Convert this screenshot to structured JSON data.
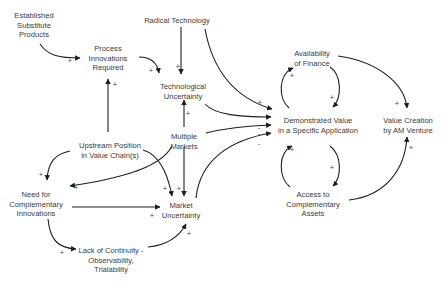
{
  "diagram": {
    "type": "causal-loop-diagram",
    "nodes": [
      {
        "id": "established_substitute",
        "lines": [
          "Established",
          "Substitute",
          "Products"
        ],
        "x": 34,
        "y": 11
      },
      {
        "id": "radical_technology",
        "lines": [
          "Radical Technology"
        ],
        "x": 177,
        "y": 16
      },
      {
        "id": "process_innovations",
        "lines": [
          "Process",
          "Innovations",
          "Required"
        ],
        "x": 108,
        "y": 44
      },
      {
        "id": "technological_uncertainty",
        "lines": [
          "Technological",
          "Uncertainty"
        ],
        "x": 183,
        "y": 82
      },
      {
        "id": "availability_finance",
        "lines": [
          "Availability",
          "of Finance"
        ],
        "x": 312,
        "y": 49
      },
      {
        "id": "upstream_position",
        "lines": [
          "Upstream Position",
          "in Value Chain(s)"
        ],
        "x": 110,
        "y": 141
      },
      {
        "id": "multiple_markets",
        "lines": [
          "Multiple",
          "Markets"
        ],
        "x": 184,
        "y": 132
      },
      {
        "id": "demonstrated_value",
        "lines": [
          "Demonstrated Value",
          "in a Specific Application"
        ],
        "x": 318,
        "y": 116
      },
      {
        "id": "value_creation",
        "lines": [
          "Value Creation",
          "by AM Venture"
        ],
        "x": 408,
        "y": 116
      },
      {
        "id": "need_complementary",
        "lines": [
          "Need for",
          "Complementary",
          "Innovations"
        ],
        "x": 36,
        "y": 190
      },
      {
        "id": "market_uncertainty",
        "lines": [
          "Market",
          "Uncertainty"
        ],
        "x": 181,
        "y": 201
      },
      {
        "id": "access_assets",
        "lines": [
          "Access to",
          "Complementary",
          "Assets"
        ],
        "x": 313,
        "y": 190
      },
      {
        "id": "lack_continuity",
        "lines": [
          "Lack of Continuity -",
          "Observability,",
          "Trialability"
        ],
        "x": 111,
        "y": 246
      }
    ],
    "edges": [
      {
        "from": "Established Substitute Products",
        "to": "Process Innovations Required",
        "polarity": "+"
      },
      {
        "from": "Upstream Position in Value Chain(s)",
        "to": "Process Innovations Required",
        "polarity": "+"
      },
      {
        "from": "Process Innovations Required",
        "to": "Technological Uncertainty",
        "polarity": "+"
      },
      {
        "from": "Radical Technology",
        "to": "Technological Uncertainty",
        "polarity": "+"
      },
      {
        "from": "Radical Technology",
        "to": "Demonstrated Value in a Specific Application",
        "polarity": "+"
      },
      {
        "from": "Technological Uncertainty",
        "to": "Demonstrated Value in a Specific Application",
        "polarity": "-"
      },
      {
        "from": "Multiple Markets",
        "to": "Demonstrated Value in a Specific Application",
        "polarity": "-"
      },
      {
        "from": "Market Uncertainty",
        "to": "Demonstrated Value in a Specific Application",
        "polarity": "-"
      },
      {
        "from": "Multiple Markets",
        "to": "Technological Uncertainty",
        "polarity": "+"
      },
      {
        "from": "Multiple Markets",
        "to": "Market Uncertainty",
        "polarity": "+"
      },
      {
        "from": "Multiple Markets",
        "to": "Need for Complementary Innovations",
        "polarity": "+"
      },
      {
        "from": "Upstream Position in Value Chain(s)",
        "to": "Need for Complementary Innovations",
        "polarity": "+"
      },
      {
        "from": "Upstream Position in Value Chain(s)",
        "to": "Market Uncertainty",
        "polarity": "+"
      },
      {
        "from": "Need for Complementary Innovations",
        "to": "Market Uncertainty",
        "polarity": "+"
      },
      {
        "from": "Need for Complementary Innovations",
        "to": "Lack of Continuity - Observability, Trialability",
        "polarity": "+"
      },
      {
        "from": "Lack of Continuity - Observability, Trialability",
        "to": "Market Uncertainty",
        "polarity": "+"
      },
      {
        "from": "Demonstrated Value in a Specific Application",
        "to": "Availability of Finance",
        "polarity": "+"
      },
      {
        "from": "Availability of Finance",
        "to": "Demonstrated Value in a Specific Application",
        "polarity": "+"
      },
      {
        "from": "Demonstrated Value in a Specific Application",
        "to": "Access to Complementary Assets",
        "polarity": "+"
      },
      {
        "from": "Access to Complementary Assets",
        "to": "Demonstrated Value in a Specific Application",
        "polarity": "+"
      },
      {
        "from": "Availability of Finance",
        "to": "Value Creation by AM Venture",
        "polarity": "+"
      },
      {
        "from": "Access to Complementary Assets",
        "to": "Value Creation by AM Venture",
        "polarity": "+"
      }
    ],
    "signs": [
      {
        "s": "+",
        "x": 70,
        "y": 61
      },
      {
        "s": "+",
        "x": 115,
        "y": 85
      },
      {
        "s": "+",
        "x": 151,
        "y": 71
      },
      {
        "s": "+",
        "x": 178,
        "y": 67
      },
      {
        "s": "+",
        "x": 188,
        "y": 114
      },
      {
        "s": "+",
        "x": 260,
        "y": 103
      },
      {
        "s": "-",
        "x": 259,
        "y": 128
      },
      {
        "s": "-",
        "x": 259,
        "y": 134
      },
      {
        "s": "-",
        "x": 259,
        "y": 144
      },
      {
        "s": "+",
        "x": 41,
        "y": 175
      },
      {
        "s": "+",
        "x": 76,
        "y": 188
      },
      {
        "s": "+",
        "x": 165,
        "y": 189
      },
      {
        "s": "+",
        "x": 179,
        "y": 189
      },
      {
        "s": "+",
        "x": 152,
        "y": 216
      },
      {
        "s": "+",
        "x": 189,
        "y": 234
      },
      {
        "s": "+",
        "x": 62,
        "y": 253
      },
      {
        "s": "+",
        "x": 292,
        "y": 76
      },
      {
        "s": "+",
        "x": 332,
        "y": 98
      },
      {
        "s": "+",
        "x": 397,
        "y": 104
      },
      {
        "s": "+",
        "x": 292,
        "y": 150
      },
      {
        "s": "+",
        "x": 332,
        "y": 168
      },
      {
        "s": "+",
        "x": 411,
        "y": 148
      }
    ]
  }
}
